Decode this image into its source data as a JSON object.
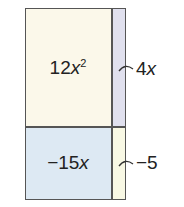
{
  "diagram": {
    "type": "area-model",
    "cells": [
      {
        "id": "top-left",
        "coefficient": "12",
        "variable": "x",
        "exponent": "2",
        "color": "#fbf8ea"
      },
      {
        "id": "top-right",
        "color": "#e0e0ee"
      },
      {
        "id": "bottom-left",
        "coefficient": "−15",
        "variable": "x",
        "color": "#dde9f3"
      },
      {
        "id": "bottom-right",
        "color": "#f8f8e4"
      }
    ],
    "side_labels": [
      {
        "id": "top",
        "coefficient": "4",
        "variable": "x"
      },
      {
        "id": "bottom",
        "text": "−5"
      }
    ],
    "line_color": "#555555"
  }
}
